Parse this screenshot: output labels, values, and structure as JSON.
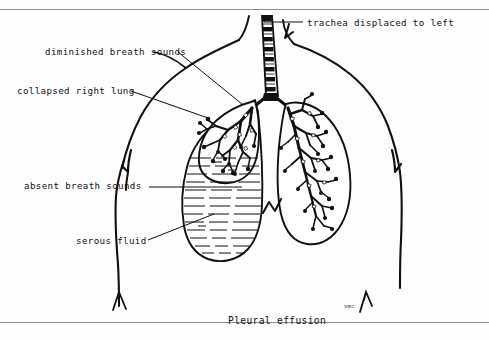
{
  "figure": {
    "caption": "Pleural effusion",
    "artist_signature": "vmc",
    "ink_color": "#111111",
    "rule_color": "#8b8b8b",
    "background_color": "#fefefe"
  },
  "labels": {
    "trachea": "trachea displaced to left",
    "diminished": "diminished breath sounds",
    "collapsed": "collapsed right lung",
    "absent": "absent breath sounds",
    "serous": "serous fluid"
  },
  "anatomy": {
    "torso_outline": "neck, shoulders, chest wall and arms",
    "trachea": "segmented cartilage-ring trachea deviated to the patient's left",
    "right_lung": "small collapsed lung compressed superiorly, bronchial tree visible",
    "left_lung": "normally expanded lung with full bronchial tree",
    "effusion": "horizontal dashed fluid lines filling the right hemithorax",
    "diaphragm": "costophrenic angle notch at midline"
  }
}
